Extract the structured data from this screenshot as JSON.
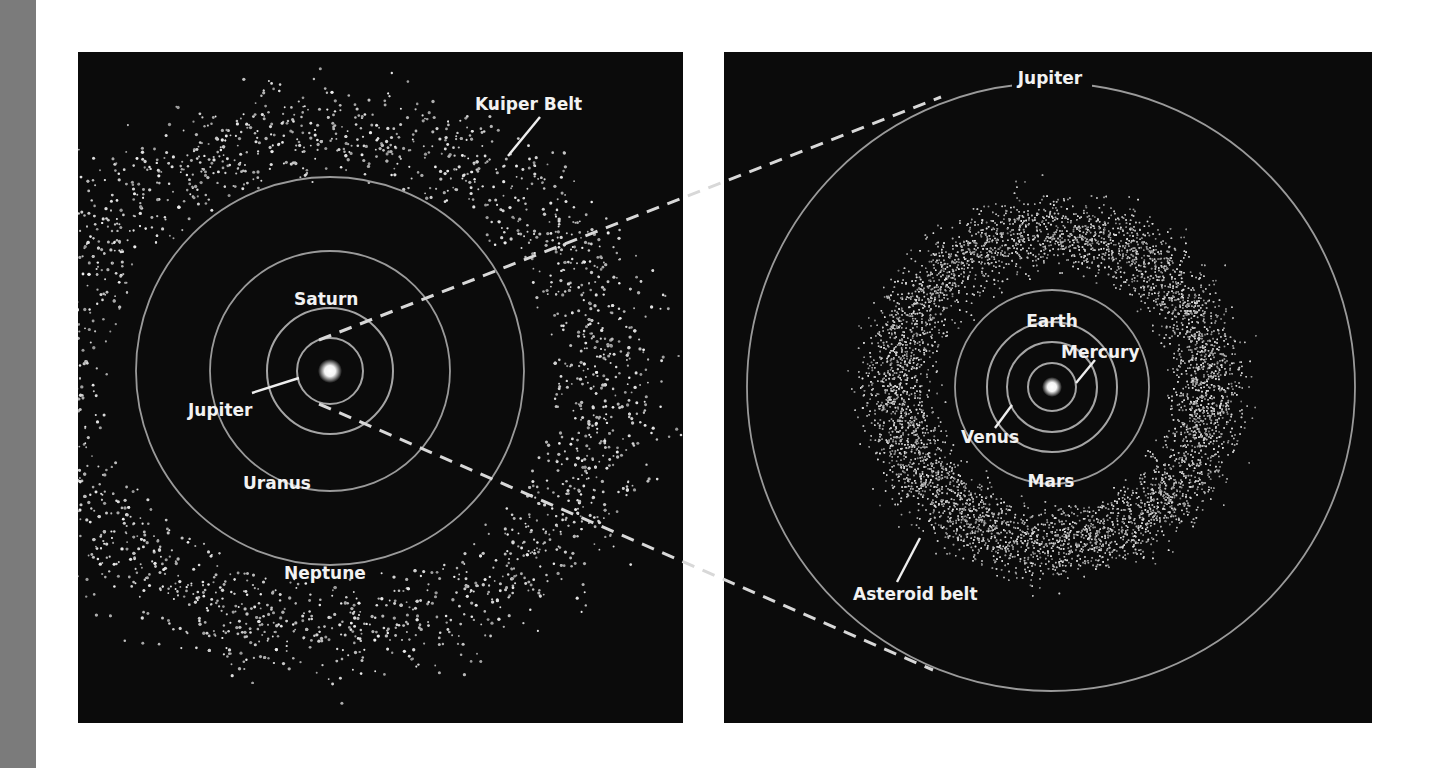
{
  "figure": {
    "left_panel": {
      "name": "outer-solar-system",
      "labels": {
        "kuiper_belt": "Kuiper Belt",
        "saturn": "Saturn",
        "jupiter": "Jupiter",
        "uranus": "Uranus",
        "neptune": "Neptune"
      }
    },
    "right_panel": {
      "name": "inner-solar-system",
      "labels": {
        "jupiter": "Jupiter",
        "earth": "Earth",
        "mercury": "Mercury",
        "venus": "Venus",
        "mars": "Mars",
        "asteroid_belt": "Asteroid belt"
      }
    }
  },
  "colors": {
    "panel_background": "#0b0b0b",
    "page_background": "#ffffff",
    "side_band": "#7b7b7b",
    "orbit_line": "#9a9a9a",
    "label_text": "#f2f2f2"
  }
}
